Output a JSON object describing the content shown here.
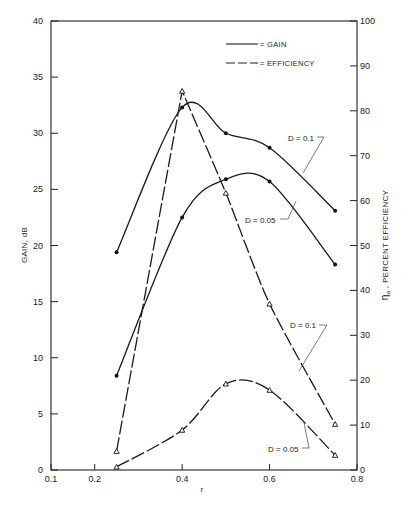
{
  "chart_data": {
    "type": "line",
    "title": "",
    "xlabel": "r",
    "ylabel": "GAIN, dB",
    "y2label": "η_a , PERCENT EFFICIENCY",
    "xlim": [
      0.1,
      0.8
    ],
    "ylim": [
      0,
      40
    ],
    "y2lim": [
      0,
      100
    ],
    "grid": false,
    "legend_position": "top-center-right",
    "x_ticks": [
      "0.1",
      "0.2",
      "0.4",
      "0.6",
      "0.8"
    ],
    "y_ticks": [
      "0",
      "5",
      "10",
      "15",
      "20",
      "25",
      "30",
      "35",
      "40"
    ],
    "y2_ticks": [
      "0",
      "10",
      "20",
      "30",
      "40",
      "50",
      "60",
      "70",
      "80",
      "90",
      "100"
    ],
    "legend": [
      {
        "label": "= GAIN",
        "style": "solid"
      },
      {
        "label": "= EFFICIENCY",
        "style": "dashed"
      }
    ],
    "x": [
      0.25,
      0.4,
      0.5,
      0.6,
      0.75
    ],
    "series": [
      {
        "name": "Gain D = 0.1",
        "axis": "left",
        "style": "solid",
        "marker": "dot",
        "values": [
          19.4,
          32.3,
          30.0,
          28.7,
          23.1
        ]
      },
      {
        "name": "Gain D = 0.05",
        "axis": "left",
        "style": "solid",
        "marker": "dot",
        "values": [
          8.4,
          22.5,
          25.9,
          25.7,
          18.3
        ]
      },
      {
        "name": "Efficiency D = 0.1",
        "axis": "right",
        "style": "dashed",
        "marker": "triangle",
        "values": [
          4.2,
          84.4,
          61.7,
          37.0,
          10.2
        ]
      },
      {
        "name": "Efficiency D = 0.05",
        "axis": "right",
        "style": "dashed",
        "marker": "triangle",
        "values": [
          0.7,
          8.9,
          19.2,
          17.8,
          3.3
        ]
      }
    ],
    "annotations": [
      {
        "text": "D = 0.1",
        "target": "Gain D = 0.1"
      },
      {
        "text": "D = 0.05",
        "target": "Gain D = 0.05"
      },
      {
        "text": "D = 0.1",
        "target": "Efficiency D = 0.1"
      },
      {
        "text": "D = 0.05",
        "target": "Efficiency D = 0.05"
      }
    ]
  },
  "labels": {
    "xlabel": "r",
    "ylabel": "GAIN,  dB",
    "y2label_prefix": "η",
    "y2label_sub": "a",
    "y2label_rest": " ,   PERCENT   EFFICIENCY",
    "legend_gain": "= GAIN",
    "legend_eff": "= EFFICIENCY",
    "anno_gain_01": "D = 0.1",
    "anno_gain_005": "D = 0.05",
    "anno_eff_01": "D = 0.1",
    "anno_eff_005": "D = 0.05"
  }
}
